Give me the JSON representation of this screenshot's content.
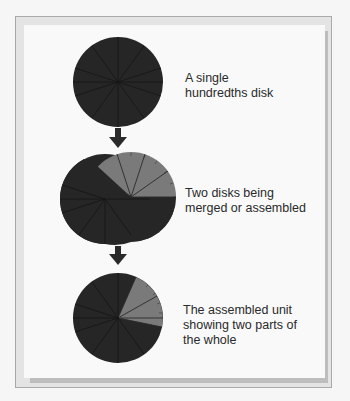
{
  "figure": {
    "steps": [
      {
        "label_line1": "A single",
        "label_line2": "hundredths disk",
        "label_line3": ""
      },
      {
        "label_line1": "Two disks being",
        "label_line2": "merged or assembled",
        "label_line3": ""
      },
      {
        "label_line1": "The assembled unit",
        "label_line2": "showing two parts of",
        "label_line3": "the whole"
      }
    ],
    "colors": {
      "dark_disk": "#262626",
      "light_disk": "#7a7a7a",
      "frame_border": "#a9a9a9",
      "panel": "#f9f9f9",
      "shadow": "#bdbdbd"
    }
  }
}
